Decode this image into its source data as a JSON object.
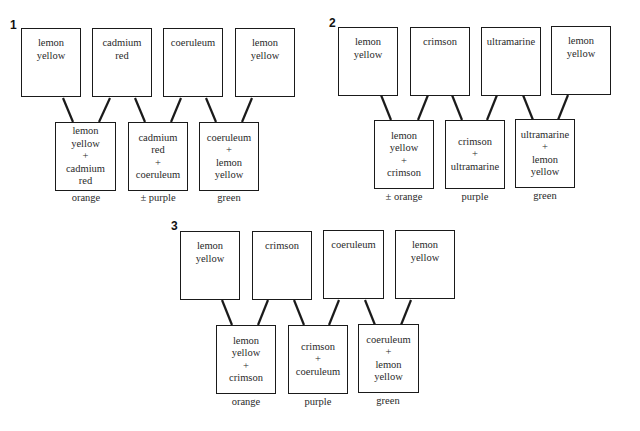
{
  "diagrams": [
    {
      "number": "1",
      "sources": [
        {
          "lines": [
            "lemon",
            "yellow"
          ]
        },
        {
          "lines": [
            "cadmium",
            "red"
          ]
        },
        {
          "lines": [
            "coeruleum"
          ]
        },
        {
          "lines": [
            "lemon",
            "yellow"
          ]
        }
      ],
      "mixes": [
        {
          "lines": [
            "lemon",
            "yellow",
            "+",
            "cadmium",
            "red"
          ],
          "result": "orange"
        },
        {
          "lines": [
            "cadmium",
            "red",
            "+",
            "coeruleum"
          ],
          "result": "± purple"
        },
        {
          "lines": [
            "coeruleum",
            "+",
            "lemon",
            "yellow"
          ],
          "result": "green"
        }
      ]
    },
    {
      "number": "2",
      "sources": [
        {
          "lines": [
            "lemon",
            "yellow"
          ]
        },
        {
          "lines": [
            "crimson"
          ]
        },
        {
          "lines": [
            "ultramarine"
          ]
        },
        {
          "lines": [
            "lemon",
            "yellow"
          ]
        }
      ],
      "mixes": [
        {
          "lines": [
            "lemon",
            "yellow",
            "+",
            "crimson"
          ],
          "result": "± orange"
        },
        {
          "lines": [
            "crimson",
            "+",
            "ultramarine"
          ],
          "result": "purple"
        },
        {
          "lines": [
            "ultramarine",
            "+",
            "lemon",
            "yellow"
          ],
          "result": "green"
        }
      ]
    },
    {
      "number": "3",
      "sources": [
        {
          "lines": [
            "lemon",
            "yellow"
          ]
        },
        {
          "lines": [
            "crimson"
          ]
        },
        {
          "lines": [
            "coeruleum"
          ]
        },
        {
          "lines": [
            "lemon",
            "yellow"
          ]
        }
      ],
      "mixes": [
        {
          "lines": [
            "lemon",
            "yellow",
            "+",
            "crimson"
          ],
          "result": "orange"
        },
        {
          "lines": [
            "crimson",
            "+",
            "coeruleum"
          ],
          "result": "purple"
        },
        {
          "lines": [
            "coeruleum",
            "+",
            "lemon",
            "yellow"
          ],
          "result": "green"
        }
      ]
    }
  ],
  "colors": {
    "stroke": "#1a1a1a",
    "text": "#2a2a2a",
    "background": "#ffffff"
  }
}
